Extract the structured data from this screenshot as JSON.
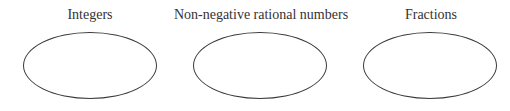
{
  "sets": [
    {
      "label": "Integers",
      "center_x": 90,
      "ellipse_left": 23
    },
    {
      "label": "Non-negative rational numbers",
      "center_x": 261,
      "ellipse_left": 193
    },
    {
      "label": "Fractions",
      "center_x": 431,
      "ellipse_left": 363
    }
  ]
}
